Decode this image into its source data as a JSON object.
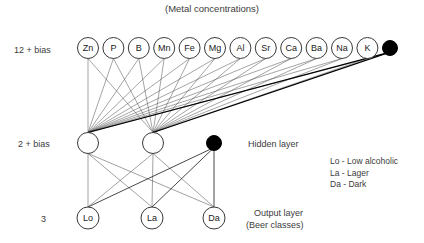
{
  "title": "(Metal concentrations)",
  "layers": {
    "input": {
      "count_label": "12 + bias",
      "cy": 48,
      "r": 10.5,
      "x_start": 88,
      "x_step": 25.4,
      "nodes": [
        {
          "label": "Zn"
        },
        {
          "label": "P"
        },
        {
          "label": "B"
        },
        {
          "label": "Mn"
        },
        {
          "label": "Fe"
        },
        {
          "label": "Mg"
        },
        {
          "label": "Al"
        },
        {
          "label": "Sr"
        },
        {
          "label": "Ca"
        },
        {
          "label": "Ba"
        },
        {
          "label": "Na"
        },
        {
          "label": "K"
        }
      ],
      "bias": {
        "label": "",
        "cx": 390,
        "cy": 48,
        "r": 7.5
      }
    },
    "hidden": {
      "count_label": "2 + bias",
      "layer_label": "Hidden layer",
      "cy": 143,
      "r": 10.5,
      "nodes": [
        {
          "label": "",
          "cx": 88
        },
        {
          "label": "",
          "cx": 153
        }
      ],
      "bias": {
        "label": "",
        "cx": 214,
        "cy": 143,
        "r": 7.5
      }
    },
    "output": {
      "count_label": "3",
      "layer_label": "Output layer",
      "layer_sublabel": "(Beer classes)",
      "cy": 218,
      "r": 11,
      "nodes": [
        {
          "label": "Lo",
          "cx": 88
        },
        {
          "label": "La",
          "cx": 152
        },
        {
          "label": "Da",
          "cx": 214
        }
      ]
    }
  },
  "legend": [
    "Lo - Low alcoholic",
    "La - Lager",
    "Da - Dark"
  ],
  "colors": {
    "background": "#ffffff",
    "node_stroke": "#3a3a3a",
    "bias_fill": "#000000",
    "edge": "#4a4a4a",
    "text": "#3c3c3c"
  }
}
